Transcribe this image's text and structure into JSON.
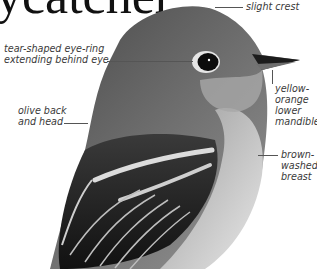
{
  "title": {
    "text": "ycatcher"
  },
  "annotations": {
    "crest": "slight crest",
    "eye_ring_line1": "tear-shaped eye-ring",
    "eye_ring_line2": "extending behind eye",
    "back_line1": "olive back",
    "back_line2": "and head",
    "mandible_line1": "yellow-",
    "mandible_line2": "orange",
    "mandible_line3": "lower",
    "mandible_line4": "mandible",
    "breast_line1": "brown-",
    "breast_line2": "washed",
    "breast_line3": "breast"
  },
  "colors": {
    "background": "#ffffff",
    "text": "#3a3a3a",
    "bird_dark": "#1e1e1e",
    "bird_mid": "#6a6a6a",
    "bird_light": "#c8c8c8"
  }
}
